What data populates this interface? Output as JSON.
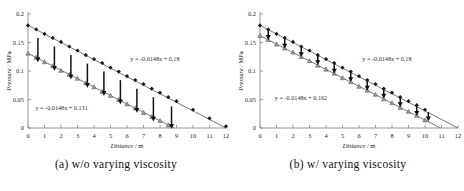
{
  "figure": {
    "panels": [
      {
        "id": "panel-a",
        "caption": "(a) w/o varying viscosity",
        "equation_upper": "y = -0.0148x + 0.18",
        "equation_lower": "y = -0.0148x + 0.131"
      },
      {
        "id": "panel-b",
        "caption": "(b) w/ varying viscosity",
        "equation_upper": "y = -0.0148x + 0.18",
        "equation_lower": "y = -0.0148x + 0.162"
      }
    ],
    "axis": {
      "xlabel_name": "Distance",
      "xlabel_unit": " / m",
      "ylabel_name": "Pressure",
      "ylabel_unit": " / MPa",
      "xticks": [
        "0",
        "1",
        "2",
        "3",
        "4",
        "5",
        "6",
        "7",
        "8",
        "9",
        "10",
        "11",
        "12"
      ],
      "yticks": [
        "0",
        "0.05",
        "0.1",
        "0.15",
        "0.2"
      ]
    }
  },
  "chart_data": [
    {
      "type": "line",
      "title": "(a) w/o varying viscosity",
      "xlabel": "Distance / m",
      "ylabel": "Pressure / MPa",
      "xlim": [
        0,
        12
      ],
      "ylim": [
        0,
        0.2
      ],
      "grid": false,
      "legend": "none",
      "annotations": [
        {
          "text": "y = -0.0148x + 0.18",
          "x": 6.2,
          "y": 0.118
        },
        {
          "text": "y = -0.0148x + 0.131",
          "x": 0.45,
          "y": 0.032
        },
        {
          "text": "downward arrows indicate pressure drop between upper and lower series"
        }
      ],
      "series": [
        {
          "name": "upper (filled diamond markers)",
          "marker": "diamond",
          "fit": "y = -0.0148x + 0.18",
          "x": [
            0,
            0.5,
            1,
            1.5,
            2,
            2.5,
            3,
            3.5,
            4,
            4.5,
            5,
            5.5,
            6,
            6.5,
            7,
            7.5,
            8,
            8.5,
            9,
            10,
            11,
            12
          ],
          "values": [
            0.18,
            0.173,
            0.165,
            0.158,
            0.151,
            0.143,
            0.136,
            0.128,
            0.121,
            0.114,
            0.106,
            0.099,
            0.091,
            0.084,
            0.077,
            0.069,
            0.062,
            0.054,
            0.047,
            0.032,
            0.017,
            0.003
          ]
        },
        {
          "name": "lower (triangle markers)",
          "marker": "triangle",
          "fit": "y = -0.0148x + 0.131",
          "x": [
            0,
            0.5,
            1,
            1.5,
            2,
            2.5,
            3,
            3.5,
            4,
            4.5,
            5,
            5.5,
            6,
            6.5,
            7,
            7.5,
            8,
            8.5
          ],
          "values": [
            0.131,
            0.124,
            0.116,
            0.109,
            0.101,
            0.094,
            0.087,
            0.079,
            0.072,
            0.064,
            0.057,
            0.05,
            0.042,
            0.035,
            0.027,
            0.02,
            0.013,
            0.005
          ]
        }
      ],
      "arrows": [
        {
          "x": 0.6,
          "y_from": 0.158,
          "y_to": 0.118
        },
        {
          "x": 1.6,
          "y_from": 0.143,
          "y_to": 0.103
        },
        {
          "x": 2.6,
          "y_from": 0.128,
          "y_to": 0.088
        },
        {
          "x": 3.6,
          "y_from": 0.113,
          "y_to": 0.073
        },
        {
          "x": 4.6,
          "y_from": 0.099,
          "y_to": 0.059
        },
        {
          "x": 5.6,
          "y_from": 0.084,
          "y_to": 0.044
        },
        {
          "x": 6.6,
          "y_from": 0.069,
          "y_to": 0.029
        },
        {
          "x": 7.6,
          "y_from": 0.054,
          "y_to": 0.014
        },
        {
          "x": 8.7,
          "y_from": 0.038,
          "y_to": 0.001
        }
      ]
    },
    {
      "type": "line",
      "title": "(b) w/ varying viscosity",
      "xlabel": "Distance / m",
      "ylabel": "Pressure / MPa",
      "xlim": [
        0,
        12
      ],
      "ylim": [
        0,
        0.2
      ],
      "grid": false,
      "legend": "none",
      "annotations": [
        {
          "text": "y = -0.0148x + 0.18",
          "x": 6.2,
          "y": 0.118
        },
        {
          "text": "y = -0.0148x + 0.162",
          "x": 0.9,
          "y": 0.049
        },
        {
          "text": "short downward arrows indicate reduced pressure drop"
        }
      ],
      "series": [
        {
          "name": "upper (filled diamond markers)",
          "marker": "diamond",
          "fit": "y = -0.0148x + 0.18",
          "x": [
            0,
            0.5,
            1,
            1.5,
            2,
            2.5,
            3,
            3.5,
            4,
            4.5,
            5,
            5.5,
            6,
            6.5,
            7,
            7.5,
            8,
            8.5,
            9,
            9.5,
            10
          ],
          "values": [
            0.18,
            0.173,
            0.165,
            0.158,
            0.151,
            0.143,
            0.136,
            0.128,
            0.121,
            0.114,
            0.106,
            0.099,
            0.091,
            0.084,
            0.077,
            0.069,
            0.062,
            0.054,
            0.047,
            0.04,
            0.032
          ]
        },
        {
          "name": "lower (triangle markers)",
          "marker": "triangle",
          "fit": "y = -0.0148x + 0.162",
          "x": [
            0,
            0.5,
            1,
            1.5,
            2,
            2.5,
            3,
            3.5,
            4,
            4.5,
            5,
            5.5,
            6,
            6.5,
            7,
            7.5,
            8,
            8.5,
            9,
            9.5,
            10
          ],
          "values": [
            0.162,
            0.155,
            0.147,
            0.14,
            0.133,
            0.125,
            0.118,
            0.11,
            0.103,
            0.096,
            0.088,
            0.081,
            0.073,
            0.066,
            0.059,
            0.051,
            0.044,
            0.036,
            0.029,
            0.022,
            0.014
          ]
        }
      ],
      "arrows": [
        {
          "x": 0.5,
          "y_from": 0.171,
          "y_to": 0.157
        },
        {
          "x": 1.5,
          "y_from": 0.156,
          "y_to": 0.142
        },
        {
          "x": 2.5,
          "y_from": 0.141,
          "y_to": 0.127
        },
        {
          "x": 3.5,
          "y_from": 0.127,
          "y_to": 0.113
        },
        {
          "x": 4.5,
          "y_from": 0.112,
          "y_to": 0.098
        },
        {
          "x": 5.5,
          "y_from": 0.097,
          "y_to": 0.083
        },
        {
          "x": 6.5,
          "y_from": 0.082,
          "y_to": 0.068
        },
        {
          "x": 7.5,
          "y_from": 0.068,
          "y_to": 0.054
        },
        {
          "x": 8.5,
          "y_from": 0.053,
          "y_to": 0.039
        },
        {
          "x": 9.5,
          "y_from": 0.038,
          "y_to": 0.024
        },
        {
          "x": 10.2,
          "y_from": 0.028,
          "y_to": 0.014
        }
      ]
    }
  ]
}
